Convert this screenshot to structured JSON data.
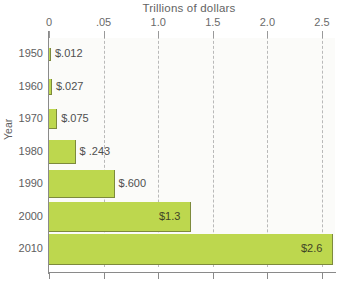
{
  "chart_data": {
    "type": "bar",
    "orientation": "horizontal",
    "title": "Trillions of dollars",
    "xlabel": "Trillions of dollars",
    "ylabel": "Year",
    "categories": [
      "1950",
      "1960",
      "1970",
      "1980",
      "1990",
      "2000",
      "2010"
    ],
    "values": [
      0.012,
      0.027,
      0.075,
      0.243,
      0.6,
      1.3,
      2.6
    ],
    "value_labels": [
      "$.012",
      "$.027",
      "$.075",
      "$ .243",
      "$.600",
      "$1.3",
      "$2.6"
    ],
    "xlim": [
      0,
      2.5
    ],
    "xticks": [
      0,
      0.5,
      1.0,
      1.5,
      2.0,
      2.5
    ],
    "xtick_labels": [
      "0",
      ".05",
      "1.0",
      "1.5",
      "2.0",
      "2.5"
    ],
    "grid": true,
    "legend": false,
    "bar_color": "#bdd74e",
    "bar_edge_color": "#7d8a3c",
    "plot_background": "#fbfbf9"
  },
  "axis": {
    "y_title": "Year",
    "x_title": "Trillions of dollars"
  },
  "rows": [
    {
      "year": "1950",
      "label": "$.012",
      "label_inside": false
    },
    {
      "year": "1960",
      "label": "$.027",
      "label_inside": false
    },
    {
      "year": "1970",
      "label": "$.075",
      "label_inside": false
    },
    {
      "year": "1980",
      "label": "$ .243",
      "label_inside": false
    },
    {
      "year": "1990",
      "label": "$.600",
      "label_inside": false
    },
    {
      "year": "2000",
      "label": "$1.3",
      "label_inside": true
    },
    {
      "year": "2010",
      "label": "$2.6",
      "label_inside": true
    }
  ],
  "xticks": [
    {
      "label": "0"
    },
    {
      "label": ".05"
    },
    {
      "label": "1.0"
    },
    {
      "label": "1.5"
    },
    {
      "label": "2.0"
    },
    {
      "label": "2.5"
    }
  ]
}
